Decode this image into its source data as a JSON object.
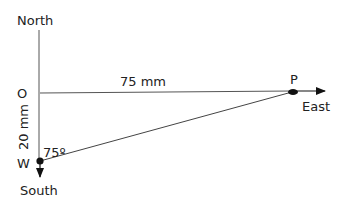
{
  "diagram": {
    "type": "vector-displacement",
    "labels": {
      "north": "North",
      "south": "South",
      "east": "East",
      "origin": "O",
      "point_p": "P",
      "point_w": "W",
      "distance_op": "75 mm",
      "distance_ow": "20 mm",
      "angle_w": "75º"
    },
    "colors": {
      "line": "#555555",
      "text": "#222222",
      "point": "#111111"
    }
  }
}
